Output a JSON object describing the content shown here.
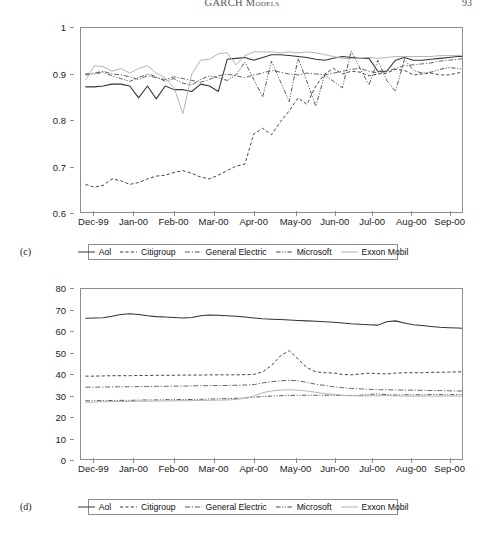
{
  "running_head": {
    "title": "GARCH Models",
    "page_number": "93"
  },
  "panels": [
    {
      "id": "c",
      "label": "(c)",
      "legend": [
        {
          "name": "Aol",
          "style": "solid",
          "color": "#333333",
          "width": 1.0
        },
        {
          "name": "Citigroup",
          "style": "dashed",
          "color": "#333333",
          "width": 0.9
        },
        {
          "name": "General Electric",
          "style": "dashdot",
          "color": "#555555",
          "width": 0.9
        },
        {
          "name": "Microsoft",
          "style": "dashdotdot",
          "color": "#444444",
          "width": 0.9
        },
        {
          "name": "Exxon Mobil",
          "style": "solid-light",
          "color": "#b0b0b0",
          "width": 1.0
        }
      ]
    },
    {
      "id": "d",
      "label": "(d)",
      "legend": [
        {
          "name": "Aol",
          "style": "solid",
          "color": "#333333",
          "width": 1.0
        },
        {
          "name": "Citigroup",
          "style": "dashed",
          "color": "#333333",
          "width": 0.9
        },
        {
          "name": "General Electric",
          "style": "dashdot",
          "color": "#555555",
          "width": 0.9
        },
        {
          "name": "Microsoft",
          "style": "dashdotdot",
          "color": "#444444",
          "width": 0.9
        },
        {
          "name": "Exxon Mobil",
          "style": "solid-light",
          "color": "#b0b0b0",
          "width": 1.0
        }
      ]
    }
  ],
  "chart_data": [
    {
      "panel": "c",
      "type": "line",
      "title": "",
      "xlabel": "",
      "ylabel": "",
      "grid": false,
      "legend_position": "below",
      "xlim": [
        0,
        43
      ],
      "ylim": [
        0.6,
        1.0
      ],
      "yticks": [
        0.6,
        0.7,
        0.8,
        0.9,
        1
      ],
      "ytick_labels": [
        "0.6",
        "0.7",
        "0.8",
        "0.9",
        "1"
      ],
      "xtick_labels": [
        "Dec-99",
        "Jan-00",
        "Feb-00",
        "Mar-00",
        "Apr-00",
        "May-00",
        "Jun-00",
        "Jul-00",
        "Aug-00",
        "Sep-00"
      ],
      "xtick_positions": [
        1.5,
        6.0,
        10.5,
        15.0,
        19.5,
        24.2,
        28.6,
        32.8,
        37.2,
        41.5
      ],
      "series": [
        {
          "name": "Aol",
          "style": "solid",
          "color": "#333333",
          "values": [
            0.872,
            0.872,
            0.874,
            0.878,
            0.878,
            0.874,
            0.848,
            0.874,
            0.846,
            0.874,
            0.866,
            0.866,
            0.862,
            0.878,
            0.874,
            0.862,
            0.932,
            0.934,
            0.936,
            0.93,
            0.936,
            0.942,
            0.942,
            0.94,
            0.938,
            0.936,
            0.932,
            0.93,
            0.934,
            0.938,
            0.936,
            0.934,
            0.934,
            0.906,
            0.906,
            0.93,
            0.936,
            0.93,
            0.93,
            0.932,
            0.934,
            0.936,
            0.938,
            0.938
          ]
        },
        {
          "name": "Citigroup",
          "style": "dashed",
          "color": "#333333",
          "values": [
            0.66,
            0.654,
            0.658,
            0.672,
            0.668,
            0.66,
            0.664,
            0.672,
            0.678,
            0.68,
            0.686,
            0.69,
            0.684,
            0.676,
            0.672,
            0.68,
            0.69,
            0.7,
            0.704,
            0.77,
            0.782,
            0.768,
            0.796,
            0.82,
            0.848,
            0.834,
            0.874,
            0.9,
            0.912,
            0.9,
            0.906,
            0.904,
            0.896,
            0.9,
            0.902,
            0.91,
            0.908,
            0.898,
            0.9,
            0.902,
            0.898,
            0.898,
            0.902,
            0.906
          ]
        },
        {
          "name": "General Electric",
          "style": "dashdot",
          "color": "#555555",
          "values": [
            0.9,
            0.902,
            0.906,
            0.9,
            0.898,
            0.894,
            0.888,
            0.896,
            0.892,
            0.888,
            0.894,
            0.89,
            0.886,
            0.882,
            0.888,
            0.896,
            0.9,
            0.896,
            0.892,
            0.898,
            0.902,
            0.908,
            0.904,
            0.9,
            0.898,
            0.902,
            0.9,
            0.898,
            0.902,
            0.906,
            0.91,
            0.912,
            0.906,
            0.902,
            0.906,
            0.912,
            0.918,
            0.92,
            0.922,
            0.924,
            0.928,
            0.93,
            0.932,
            0.934
          ]
        },
        {
          "name": "Microsoft",
          "style": "dashdotdot",
          "color": "#444444",
          "values": [
            0.898,
            0.9,
            0.904,
            0.896,
            0.89,
            0.884,
            0.892,
            0.9,
            0.894,
            0.884,
            0.89,
            0.88,
            0.876,
            0.888,
            0.896,
            0.892,
            0.886,
            0.898,
            0.926,
            0.888,
            0.85,
            0.928,
            0.884,
            0.84,
            0.934,
            0.884,
            0.83,
            0.898,
            0.884,
            0.87,
            0.95,
            0.912,
            0.876,
            0.93,
            0.886,
            0.862,
            0.932,
            0.908,
            0.902,
            0.904,
            0.91,
            0.914,
            0.912,
            0.91
          ]
        },
        {
          "name": "Exxon Mobil",
          "style": "solid-light",
          "color": "#b0b0b0",
          "values": [
            0.886,
            0.918,
            0.916,
            0.906,
            0.912,
            0.902,
            0.912,
            0.918,
            0.902,
            0.892,
            0.87,
            0.814,
            0.9,
            0.93,
            0.932,
            0.944,
            0.946,
            0.92,
            0.94,
            0.948,
            0.948,
            0.948,
            0.946,
            0.948,
            0.946,
            0.948,
            0.946,
            0.942,
            0.938,
            0.934,
            0.934,
            0.934,
            0.936,
            0.934,
            0.936,
            0.938,
            0.938,
            0.938,
            0.938,
            0.938,
            0.94,
            0.94,
            0.94,
            0.94
          ]
        }
      ]
    },
    {
      "panel": "d",
      "type": "line",
      "title": "",
      "xlabel": "",
      "ylabel": "",
      "grid": false,
      "legend_position": "below",
      "xlim": [
        0,
        43
      ],
      "ylim": [
        0,
        80
      ],
      "yticks": [
        0,
        10,
        20,
        30,
        40,
        50,
        60,
        70,
        80
      ],
      "ytick_labels": [
        "0",
        "10",
        "20",
        "30",
        "40",
        "50",
        "60",
        "70",
        "80"
      ],
      "xtick_labels": [
        "Dec-99",
        "Jan-00",
        "Feb-00",
        "Mar-00",
        "Apr-00",
        "May-00",
        "Jun-00",
        "Jul-00",
        "Aug-00",
        "Sep-00"
      ],
      "xtick_positions": [
        1.5,
        6.0,
        10.5,
        15.0,
        19.5,
        24.2,
        28.6,
        32.8,
        37.2,
        41.5
      ],
      "series": [
        {
          "name": "Aol",
          "style": "solid",
          "color": "#333333",
          "values": [
            66.2,
            66.4,
            66.5,
            67.2,
            68.0,
            68.4,
            68.0,
            67.4,
            67.0,
            66.8,
            66.6,
            66.4,
            66.6,
            67.4,
            67.8,
            67.6,
            67.4,
            67.2,
            66.8,
            66.4,
            66.0,
            65.8,
            65.6,
            65.4,
            65.2,
            65.0,
            64.8,
            64.6,
            64.4,
            64.0,
            63.6,
            63.4,
            63.2,
            63.0,
            64.6,
            65.0,
            64.0,
            63.2,
            62.8,
            62.4,
            62.0,
            61.8,
            61.6,
            61.4
          ]
        },
        {
          "name": "Citigroup",
          "style": "dashed",
          "color": "#333333",
          "values": [
            39.0,
            39.0,
            39.1,
            39.2,
            39.2,
            39.2,
            39.3,
            39.3,
            39.4,
            39.4,
            39.4,
            39.5,
            39.5,
            39.5,
            39.6,
            39.6,
            39.6,
            39.6,
            39.7,
            39.8,
            41.0,
            44.0,
            48.5,
            51.0,
            47.0,
            43.0,
            41.0,
            40.6,
            40.5,
            39.8,
            39.6,
            40.0,
            40.4,
            40.2,
            40.0,
            40.4,
            40.6,
            40.6,
            40.6,
            40.8,
            40.8,
            40.9,
            41.0,
            41.0
          ]
        },
        {
          "name": "General Electric",
          "style": "dashdot",
          "color": "#555555",
          "values": [
            33.8,
            33.8,
            33.9,
            33.9,
            34.0,
            34.0,
            34.1,
            34.1,
            34.2,
            34.2,
            34.3,
            34.3,
            34.4,
            34.5,
            34.5,
            34.6,
            34.6,
            34.7,
            34.8,
            35.0,
            35.8,
            36.4,
            36.8,
            37.0,
            36.8,
            36.0,
            35.2,
            34.6,
            34.0,
            33.6,
            33.2,
            33.0,
            32.8,
            32.6,
            32.6,
            32.5,
            32.4,
            32.4,
            32.3,
            32.2,
            32.2,
            32.1,
            32.0,
            32.0
          ]
        },
        {
          "name": "Microsoft",
          "style": "dashdotdot",
          "color": "#444444",
          "values": [
            27.4,
            27.4,
            27.5,
            27.5,
            27.6,
            27.6,
            27.7,
            27.8,
            27.8,
            27.9,
            27.9,
            28.0,
            28.0,
            28.1,
            28.2,
            28.3,
            28.4,
            28.6,
            28.8,
            29.0,
            29.4,
            29.6,
            29.8,
            29.9,
            30.0,
            30.0,
            30.0,
            30.0,
            30.0,
            29.9,
            29.9,
            30.0,
            30.4,
            30.6,
            30.3,
            30.1,
            30.2,
            30.2,
            30.2,
            30.3,
            30.3,
            30.3,
            30.3,
            30.3
          ]
        },
        {
          "name": "Exxon Mobil",
          "style": "solid-light",
          "color": "#b0b0b0",
          "values": [
            26.6,
            26.8,
            27.0,
            27.0,
            27.1,
            27.1,
            27.2,
            27.2,
            27.3,
            27.3,
            27.4,
            27.4,
            27.5,
            27.6,
            27.6,
            27.7,
            27.8,
            28.0,
            28.6,
            29.6,
            31.2,
            32.0,
            32.4,
            32.6,
            32.4,
            32.0,
            31.4,
            30.8,
            30.4,
            30.0,
            29.8,
            29.7,
            29.7,
            29.8,
            29.9,
            29.7,
            29.6,
            29.6,
            29.6,
            29.6,
            29.6,
            29.6,
            29.6,
            29.6
          ]
        }
      ]
    }
  ]
}
